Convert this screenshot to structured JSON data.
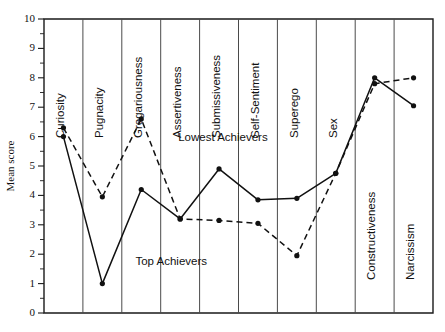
{
  "chart_data": {
    "type": "line",
    "title": "",
    "xlabel": "",
    "ylabel": "Mean score",
    "ylim": [
      0,
      10
    ],
    "ytick_labels": [
      "0",
      "1",
      "2",
      "3",
      "4",
      "5",
      "6",
      "7",
      "8",
      "9",
      "10"
    ],
    "ytick_values": [
      0,
      1,
      2,
      3,
      4,
      5,
      6,
      7,
      8,
      9,
      10
    ],
    "grid": "vertical category dividers only",
    "legend": "inline annotations on curves",
    "categories": [
      "Curiosity",
      "Pugnacity",
      "Gregariousness",
      "Assertiveness",
      "Submissiveness",
      "Self-Sentiment",
      "Superego",
      "Sex",
      "Constructiveness",
      "Narcissism"
    ],
    "series": [
      {
        "name": "Top Achievers",
        "style": "solid",
        "values": [
          6.0,
          1.0,
          4.2,
          3.2,
          4.9,
          3.85,
          3.9,
          4.75,
          8.0,
          7.05
        ]
      },
      {
        "name": "Lowest Achievers",
        "style": "dashed",
        "values": [
          6.3,
          3.95,
          6.6,
          3.2,
          3.15,
          3.05,
          1.95,
          4.75,
          7.8,
          8.0
        ]
      }
    ],
    "annotations": [
      {
        "text": "Lowest Achievers",
        "x_frac": 0.345,
        "y_value": 5.85
      },
      {
        "text": "Top Achievers",
        "x_frac": 0.235,
        "y_value": 1.62
      }
    ]
  },
  "colors": {
    "ink": "#111111",
    "divider": "#4a4a4a",
    "background": "#ffffff"
  }
}
